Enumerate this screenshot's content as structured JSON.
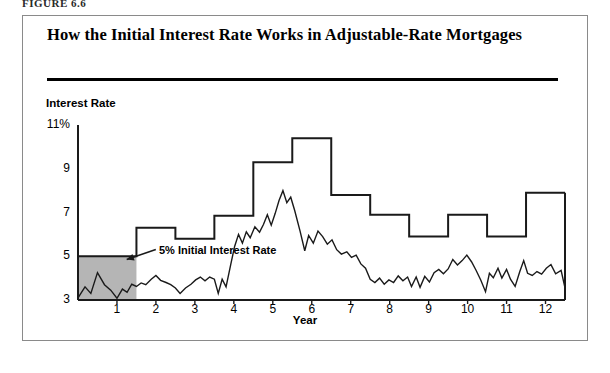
{
  "figure": {
    "label": "FIGURE 6.6",
    "title": "How the Initial Interest Rate Works in Adjustable-Rate Mortgages",
    "annotation": "5% Initial Interest Rate"
  },
  "colors": {
    "line": "#1a1a1a",
    "shade_fill": "#b5b5b5",
    "frame": "#8a8a8a",
    "rule": "#000000"
  },
  "chart_data": {
    "type": "line",
    "title": "How the Initial Interest Rate Works in Adjustable-Rate Mortgages",
    "xlabel": "Year",
    "ylabel": "Interest Rate",
    "xlim": [
      0,
      12.5
    ],
    "ylim": [
      3,
      11
    ],
    "grid": false,
    "legend": null,
    "ytick_labels": [
      "11%",
      "9",
      "7",
      "5",
      "3"
    ],
    "ytick_values": [
      11,
      9,
      7,
      5,
      3
    ],
    "xtick_labels": [
      "1",
      "2",
      "3",
      "4",
      "5",
      "6",
      "7",
      "8",
      "9",
      "10",
      "11",
      "12"
    ],
    "xtick_values": [
      1,
      2,
      3,
      4,
      5,
      6,
      7,
      8,
      9,
      10,
      11,
      12
    ],
    "annotations": [
      {
        "text": "5% Initial Interest Rate",
        "x": 2.1,
        "y": 5.45,
        "arrow_to_x": 1.25,
        "arrow_to_y": 4.85
      }
    ],
    "shaded_region": {
      "label": "initial-rate-teaser-period",
      "x_start": 0,
      "x_end": 1.5,
      "y_bottom": 3,
      "y_top": 5,
      "fill": "#b5b5b5"
    },
    "series": [
      {
        "name": "Mortgage interest rate (step)",
        "style": "step",
        "points": [
          [
            0.0,
            5.0
          ],
          [
            1.5,
            5.0
          ],
          [
            1.5,
            6.3
          ],
          [
            2.5,
            6.3
          ],
          [
            2.5,
            5.8
          ],
          [
            3.5,
            5.8
          ],
          [
            3.5,
            6.85
          ],
          [
            4.5,
            6.85
          ],
          [
            4.5,
            9.3
          ],
          [
            5.5,
            9.3
          ],
          [
            5.5,
            10.4
          ],
          [
            6.5,
            10.4
          ],
          [
            6.5,
            7.8
          ],
          [
            7.5,
            7.8
          ],
          [
            7.5,
            6.9
          ],
          [
            8.5,
            6.9
          ],
          [
            8.5,
            5.9
          ],
          [
            9.5,
            5.9
          ],
          [
            9.5,
            6.9
          ],
          [
            10.5,
            6.9
          ],
          [
            10.5,
            5.9
          ],
          [
            11.5,
            5.9
          ],
          [
            11.5,
            7.9
          ],
          [
            12.5,
            7.9
          ]
        ]
      },
      {
        "name": "Market index rate",
        "style": "zigzag",
        "points": [
          [
            0.0,
            3.1
          ],
          [
            0.18,
            3.6
          ],
          [
            0.33,
            3.3
          ],
          [
            0.5,
            4.25
          ],
          [
            0.68,
            3.7
          ],
          [
            0.84,
            3.45
          ],
          [
            1.0,
            3.08
          ],
          [
            1.14,
            3.5
          ],
          [
            1.26,
            3.35
          ],
          [
            1.38,
            3.72
          ],
          [
            1.5,
            3.62
          ],
          [
            1.62,
            3.78
          ],
          [
            1.74,
            3.7
          ],
          [
            1.88,
            3.95
          ],
          [
            2.0,
            4.12
          ],
          [
            2.12,
            3.9
          ],
          [
            2.26,
            3.8
          ],
          [
            2.38,
            3.7
          ],
          [
            2.5,
            3.55
          ],
          [
            2.62,
            3.3
          ],
          [
            2.76,
            3.55
          ],
          [
            2.9,
            3.72
          ],
          [
            3.02,
            3.92
          ],
          [
            3.14,
            4.05
          ],
          [
            3.26,
            3.88
          ],
          [
            3.38,
            4.05
          ],
          [
            3.5,
            3.95
          ],
          [
            3.6,
            3.3
          ],
          [
            3.7,
            3.95
          ],
          [
            3.8,
            3.6
          ],
          [
            3.92,
            4.62
          ],
          [
            4.02,
            5.45
          ],
          [
            4.12,
            6.0
          ],
          [
            4.22,
            5.6
          ],
          [
            4.32,
            6.12
          ],
          [
            4.42,
            5.85
          ],
          [
            4.54,
            6.35
          ],
          [
            4.66,
            6.1
          ],
          [
            4.76,
            6.45
          ],
          [
            4.86,
            6.9
          ],
          [
            4.96,
            6.42
          ],
          [
            5.06,
            6.95
          ],
          [
            5.16,
            7.55
          ],
          [
            5.26,
            8.0
          ],
          [
            5.36,
            7.45
          ],
          [
            5.46,
            7.7
          ],
          [
            5.56,
            7.1
          ],
          [
            5.7,
            6.15
          ],
          [
            5.82,
            5.25
          ],
          [
            5.92,
            5.95
          ],
          [
            6.04,
            5.6
          ],
          [
            6.16,
            6.15
          ],
          [
            6.28,
            5.9
          ],
          [
            6.4,
            5.55
          ],
          [
            6.52,
            5.75
          ],
          [
            6.64,
            5.3
          ],
          [
            6.76,
            5.1
          ],
          [
            6.9,
            5.2
          ],
          [
            7.02,
            4.95
          ],
          [
            7.14,
            5.05
          ],
          [
            7.26,
            4.65
          ],
          [
            7.38,
            4.45
          ],
          [
            7.5,
            3.95
          ],
          [
            7.62,
            3.8
          ],
          [
            7.74,
            4.0
          ],
          [
            7.86,
            3.72
          ],
          [
            7.98,
            3.92
          ],
          [
            8.1,
            3.8
          ],
          [
            8.22,
            4.1
          ],
          [
            8.34,
            3.88
          ],
          [
            8.46,
            4.05
          ],
          [
            8.56,
            3.62
          ],
          [
            8.68,
            4.05
          ],
          [
            8.78,
            3.58
          ],
          [
            8.9,
            4.08
          ],
          [
            9.02,
            3.82
          ],
          [
            9.14,
            4.25
          ],
          [
            9.26,
            4.4
          ],
          [
            9.38,
            4.2
          ],
          [
            9.5,
            4.42
          ],
          [
            9.62,
            4.85
          ],
          [
            9.74,
            4.6
          ],
          [
            9.86,
            4.8
          ],
          [
            9.98,
            5.05
          ],
          [
            10.1,
            4.75
          ],
          [
            10.22,
            4.35
          ],
          [
            10.34,
            3.9
          ],
          [
            10.46,
            3.38
          ],
          [
            10.56,
            4.22
          ],
          [
            10.66,
            4.02
          ],
          [
            10.78,
            4.45
          ],
          [
            10.88,
            4.0
          ],
          [
            11.0,
            4.4
          ],
          [
            11.1,
            3.95
          ],
          [
            11.22,
            3.62
          ],
          [
            11.34,
            4.3
          ],
          [
            11.44,
            4.8
          ],
          [
            11.54,
            4.22
          ],
          [
            11.66,
            4.12
          ],
          [
            11.78,
            4.3
          ],
          [
            11.9,
            4.18
          ],
          [
            12.02,
            4.45
          ],
          [
            12.14,
            4.62
          ],
          [
            12.26,
            4.2
          ],
          [
            12.4,
            4.35
          ],
          [
            12.5,
            3.55
          ]
        ]
      }
    ]
  }
}
